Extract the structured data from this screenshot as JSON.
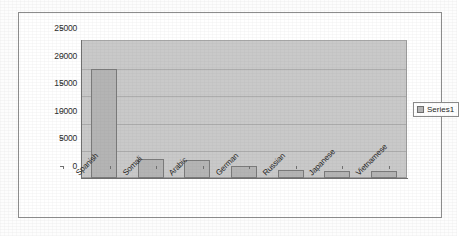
{
  "chart_data": {
    "type": "bar",
    "title": "",
    "subtitle": "",
    "xlabel": "",
    "ylabel": "",
    "categories": [
      "Spanish",
      "Somali",
      "Arabic",
      "German",
      "Russian",
      "Japanese",
      "Vietnamese"
    ],
    "values": [
      19700,
      3450,
      3250,
      2100,
      1450,
      1300,
      1250
    ],
    "series": [
      {
        "name": "Series1",
        "values": [
          19700,
          3450,
          3250,
          2100,
          1450,
          1300,
          1250
        ]
      }
    ],
    "ylim": [
      0,
      25000
    ],
    "ytick_labels": [
      "25000",
      "20000",
      "15000",
      "10000",
      "5000",
      "0"
    ],
    "ytick_values": [
      25000,
      20000,
      15000,
      10000,
      5000,
      0
    ],
    "grid": true,
    "grid_axis": "y",
    "legend": {
      "position": "right",
      "entries": [
        "Series1"
      ]
    },
    "colors": {
      "bar_fill": "#b4b4b4",
      "bar_border": "#7a7a7a",
      "plot_background": "#c9c9c9",
      "gridline": "#adadad",
      "axis": "#6f6f6f",
      "frame_border": "#8c8c8c",
      "text": "#232323",
      "page_background": "#fdfdfd"
    },
    "xlabel_rotation_degrees": -45
  }
}
